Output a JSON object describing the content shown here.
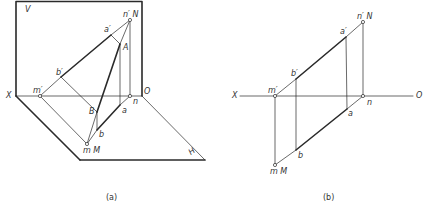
{
  "figure_a": {
    "caption": "(a)",
    "labels": {
      "V": "V",
      "H": "H",
      "X": "X",
      "O": "O",
      "n_prime_N": "n′ N",
      "a_prime": "a′",
      "A": "A",
      "b_prime": "b′",
      "m_prime": "m′",
      "n": "n",
      "a": "a",
      "B": "B",
      "b": "b",
      "mM": "m M"
    }
  },
  "figure_b": {
    "caption": "(b)",
    "labels": {
      "X": "X",
      "O": "O",
      "n_prime_N": "n′ N",
      "a_prime": "a′",
      "b_prime": "b′",
      "m_prime": "m′",
      "n": "n",
      "a": "a",
      "b": "b",
      "mM": "m M"
    }
  },
  "colors": {
    "line": "#2a2a2a",
    "label": "#333333"
  }
}
